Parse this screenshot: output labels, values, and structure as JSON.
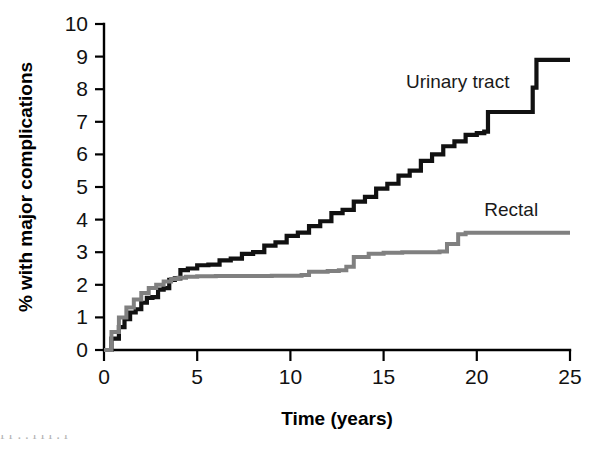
{
  "chart_data": {
    "type": "line",
    "title": "",
    "xlabel": "Time (years)",
    "ylabel": "% with major complications",
    "xlim": [
      0,
      25
    ],
    "ylim": [
      0,
      10
    ],
    "xticks": [
      0,
      5,
      10,
      15,
      20,
      25
    ],
    "yticks": [
      0,
      1,
      2,
      3,
      4,
      5,
      6,
      7,
      8,
      9,
      10
    ],
    "grid": false,
    "legend_position": "inline-annotation",
    "series": [
      {
        "name": "Urinary tract",
        "color": "#111111",
        "label_x": 16.2,
        "label_y": 8.05,
        "x": [
          0,
          0.4,
          0.8,
          1.1,
          1.4,
          1.7,
          2.0,
          2.3,
          2.6,
          2.9,
          3.2,
          3.5,
          3.8,
          4.1,
          4.5,
          5.0,
          5.6,
          6.2,
          6.8,
          7.4,
          8.0,
          8.6,
          9.2,
          9.8,
          10.4,
          11.0,
          11.6,
          12.2,
          12.8,
          13.4,
          14.0,
          14.6,
          15.2,
          15.8,
          16.4,
          17.0,
          17.6,
          18.2,
          18.8,
          19.4,
          20.0,
          20.4,
          20.6,
          22.8,
          23.0,
          23.2,
          25.0
        ],
        "y": [
          0.0,
          0.35,
          0.7,
          0.95,
          1.15,
          1.25,
          1.45,
          1.6,
          1.62,
          1.85,
          1.9,
          2.15,
          2.2,
          2.45,
          2.5,
          2.6,
          2.62,
          2.75,
          2.8,
          2.95,
          3.0,
          3.2,
          3.3,
          3.5,
          3.6,
          3.8,
          3.95,
          4.2,
          4.3,
          4.55,
          4.7,
          4.95,
          5.1,
          5.35,
          5.5,
          5.8,
          6.0,
          6.25,
          6.4,
          6.6,
          6.65,
          6.7,
          7.3,
          7.3,
          8.05,
          8.9,
          8.9
        ]
      },
      {
        "name": "Rectal",
        "color": "#808080",
        "label_x": 20.4,
        "label_y": 4.1,
        "x": [
          0,
          0.4,
          0.8,
          1.2,
          1.6,
          2.0,
          2.4,
          2.8,
          3.2,
          3.6,
          4.0,
          4.4,
          5.0,
          6.0,
          7.0,
          8.0,
          9.0,
          10.0,
          10.6,
          11.0,
          12.0,
          12.6,
          13.0,
          13.4,
          14.2,
          15.0,
          16.0,
          17.0,
          17.6,
          18.0,
          18.4,
          19.0,
          19.4,
          21.0,
          23.0,
          25.0
        ],
        "y": [
          0.0,
          0.55,
          1.0,
          1.3,
          1.55,
          1.75,
          1.9,
          2.0,
          2.1,
          2.18,
          2.22,
          2.25,
          2.26,
          2.27,
          2.27,
          2.27,
          2.28,
          2.28,
          2.3,
          2.4,
          2.42,
          2.45,
          2.55,
          2.85,
          2.95,
          2.98,
          3.0,
          3.0,
          3.0,
          3.02,
          3.25,
          3.55,
          3.6,
          3.6,
          3.6,
          3.6
        ]
      }
    ]
  },
  "axes": {
    "x_title": "Time (years)",
    "y_title": "% with major complications",
    "x_tick_labels": [
      "0",
      "5",
      "10",
      "15",
      "20",
      "25"
    ],
    "y_tick_labels": [
      "0",
      "1",
      "2",
      "3",
      "4",
      "5",
      "6",
      "7",
      "8",
      "9",
      "10"
    ]
  },
  "annotations": {
    "urinary_label": "Urinary tract",
    "rectal_label": "Rectal"
  },
  "scan_artifact": {
    "text": "f      r   .           .        l       l       l    .  l"
  },
  "colors": {
    "urinary": "#111111",
    "rectal": "#808080",
    "axis": "#000000",
    "background": "#ffffff"
  }
}
